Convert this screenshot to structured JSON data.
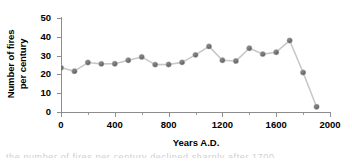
{
  "chart_data": {
    "type": "line",
    "title": "",
    "xlabel": "Years A.D.",
    "ylabel": "Number of fires per century",
    "ylabel_line1": "Number of fires",
    "ylabel_line2": "per century",
    "xlim": [
      0,
      2000
    ],
    "ylim": [
      0,
      50
    ],
    "xticks": [
      0,
      400,
      800,
      1200,
      1600,
      2000
    ],
    "xtick_labels": [
      "0",
      "400",
      "800",
      "1200",
      "1600",
      "2000"
    ],
    "yticks": [
      0,
      10,
      20,
      30,
      40,
      50
    ],
    "ytick_labels": [
      "0",
      "10",
      "20",
      "30",
      "40",
      "50"
    ],
    "xtick_minor": [
      200,
      600,
      1000,
      1400,
      1800
    ],
    "grid": false,
    "legend": null,
    "marker": "circle",
    "marker_color": "#6e6e6e",
    "line_color": "#c8c8c8",
    "x": [
      0,
      100,
      200,
      300,
      400,
      500,
      600,
      700,
      800,
      900,
      1000,
      1100,
      1200,
      1300,
      1400,
      1500,
      1600,
      1700,
      1800,
      1900
    ],
    "values": [
      23.6,
      21.7,
      26.3,
      25.6,
      25.7,
      27.5,
      29.3,
      25.2,
      25.3,
      26.4,
      30.4,
      34.9,
      27.5,
      27.1,
      33.9,
      30.8,
      31.8,
      38.0,
      21.0,
      2.8
    ],
    "series": [
      {
        "name": "Number of fires per century",
        "values": [
          23.6,
          21.7,
          26.3,
          25.6,
          25.7,
          27.5,
          29.3,
          25.2,
          25.3,
          26.4,
          30.4,
          34.9,
          27.5,
          27.1,
          33.9,
          30.8,
          31.8,
          38.0,
          21.0,
          2.8
        ]
      }
    ]
  },
  "caption_sliver": "the number of fires per century declined sharply after 1700"
}
